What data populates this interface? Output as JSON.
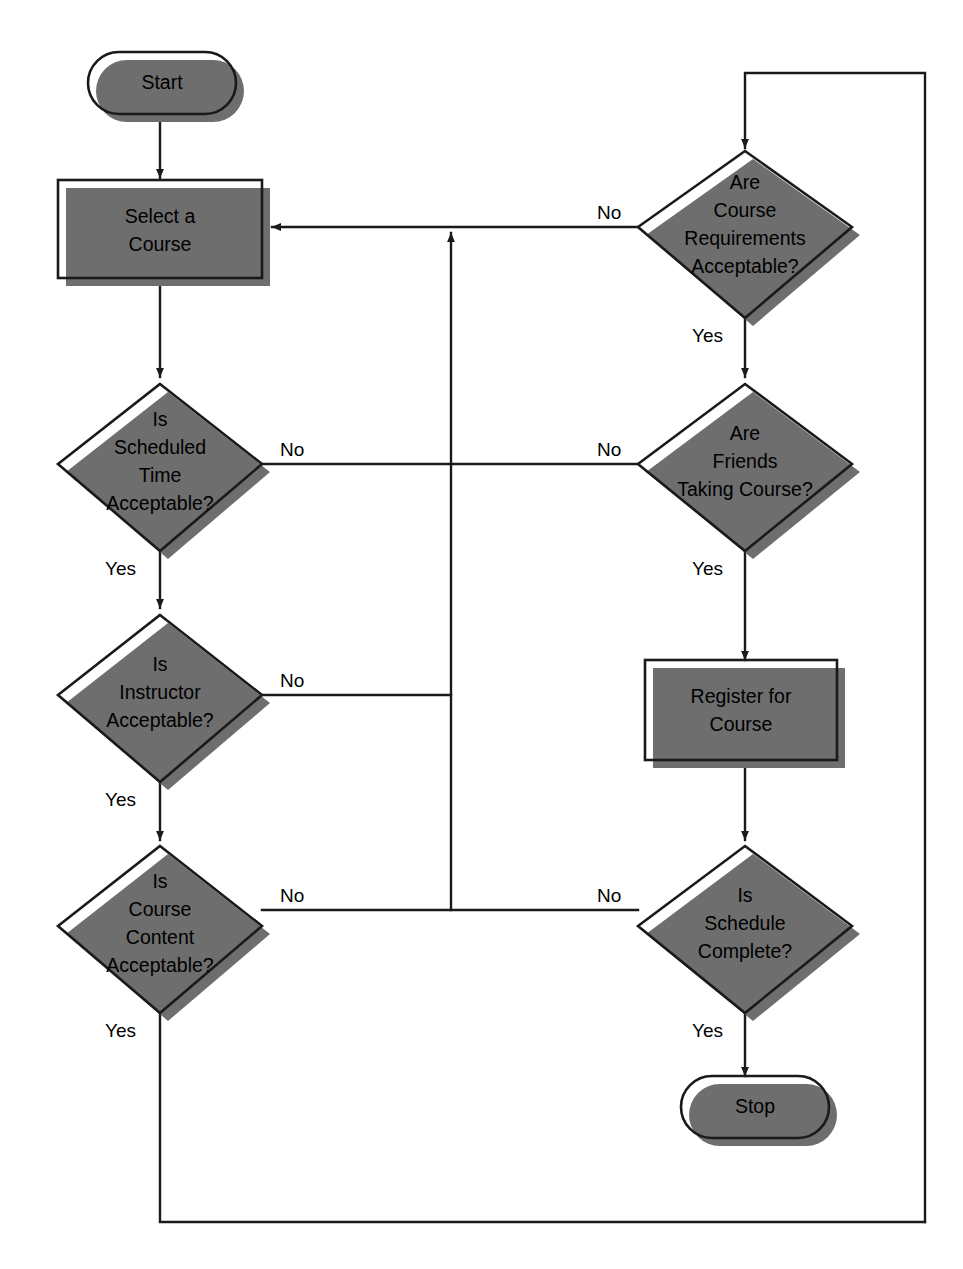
{
  "diagram": {
    "type": "flowchart",
    "colors": {
      "terminal_fill": "#a6a6a6",
      "process_fill": "#b5b5b5",
      "decision_fill": "#dcdcdc",
      "shadow": "#6e6e6e",
      "stroke": "#1a1a1a",
      "background": "#ffffff",
      "text": "#000000"
    },
    "nodes": {
      "start": {
        "id": "start",
        "shape": "terminal",
        "label": "Start"
      },
      "select_course": {
        "id": "select_course",
        "shape": "process",
        "line1": "Select a",
        "line2": "Course"
      },
      "scheduled_time": {
        "id": "scheduled_time",
        "shape": "decision",
        "line1": "Is",
        "line2": "Scheduled",
        "line3": "Time",
        "line4": "Acceptable?"
      },
      "instructor": {
        "id": "instructor",
        "shape": "decision",
        "line1": "Is",
        "line2": "Instructor",
        "line3": "Acceptable?",
        "line4": ""
      },
      "course_content": {
        "id": "course_content",
        "shape": "decision",
        "line1": "Is",
        "line2": "Course",
        "line3": "Content",
        "line4": "Acceptable?"
      },
      "course_requirements": {
        "id": "course_requirements",
        "shape": "decision",
        "line1": "Are",
        "line2": "Course",
        "line3": "Requirements",
        "line4": "Acceptable?"
      },
      "friends_taking": {
        "id": "friends_taking",
        "shape": "decision",
        "line1": "Are",
        "line2": "Friends",
        "line3": "Taking Course?",
        "line4": ""
      },
      "register": {
        "id": "register",
        "shape": "process",
        "line1": "Register for",
        "line2": "Course"
      },
      "schedule_complete": {
        "id": "schedule_complete",
        "shape": "decision",
        "line1": "Is",
        "line2": "Schedule",
        "line3": "Complete?",
        "line4": ""
      },
      "stop": {
        "id": "stop",
        "shape": "terminal",
        "label": "Stop"
      }
    },
    "edge_labels": {
      "scheduled_time_no": "No",
      "scheduled_time_yes": "Yes",
      "instructor_no": "No",
      "instructor_yes": "Yes",
      "course_content_no": "No",
      "course_content_yes": "Yes",
      "course_requirements_no": "No",
      "course_requirements_yes": "Yes",
      "friends_taking_no": "No",
      "friends_taking_yes": "Yes",
      "schedule_complete_no": "No",
      "schedule_complete_yes": "Yes"
    },
    "edges": [
      {
        "from": "start",
        "to": "select_course",
        "label": ""
      },
      {
        "from": "select_course",
        "to": "scheduled_time",
        "label": ""
      },
      {
        "from": "scheduled_time",
        "to": "friends_taking",
        "label": "No"
      },
      {
        "from": "scheduled_time",
        "to": "instructor",
        "label": "Yes"
      },
      {
        "from": "instructor",
        "to": "select_course",
        "label": "No"
      },
      {
        "from": "instructor",
        "to": "course_content",
        "label": "Yes"
      },
      {
        "from": "course_content",
        "to": "schedule_complete",
        "label": "No"
      },
      {
        "from": "course_content",
        "to": "course_requirements",
        "label": "Yes"
      },
      {
        "from": "course_requirements",
        "to": "select_course",
        "label": "No"
      },
      {
        "from": "course_requirements",
        "to": "friends_taking",
        "label": "Yes"
      },
      {
        "from": "friends_taking",
        "to": "select_course",
        "label": "No"
      },
      {
        "from": "friends_taking",
        "to": "register",
        "label": "Yes"
      },
      {
        "from": "register",
        "to": "schedule_complete",
        "label": ""
      },
      {
        "from": "schedule_complete",
        "to": "course_requirements",
        "label": "No"
      },
      {
        "from": "schedule_complete",
        "to": "stop",
        "label": "Yes"
      }
    ]
  }
}
